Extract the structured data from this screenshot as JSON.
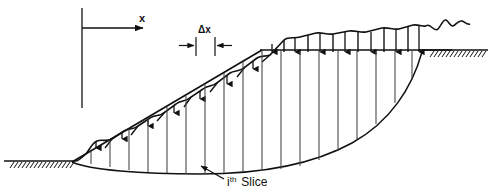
{
  "figure": {
    "background_color": "#ffffff",
    "line_color": "#111111",
    "thin_line_color": "#4a4a4a"
  },
  "labels": {
    "x_axis": "x",
    "delta_x": "Δx",
    "slice_prefix": "i",
    "slice_superscript": "th",
    "slice_word": "Slice"
  },
  "geometry": {
    "axis": {
      "vertical_x": 82,
      "vertical_y_top": 8,
      "vertical_y_bottom": 108,
      "arrow_y": 28,
      "arrow_x_start": 82,
      "arrow_x_end": 146,
      "label_x": 139,
      "label_y": 22
    },
    "ground_left": {
      "x_start": 4,
      "x_end": 75,
      "y": 161,
      "hatch_count": 16
    },
    "ground_right": {
      "x_start": 424,
      "x_end": 488,
      "y": 50,
      "hatch_count": 14
    },
    "slope_toe": {
      "x": 72,
      "y": 162
    },
    "slope_crest": {
      "x": 262,
      "y": 50
    },
    "top_datum": {
      "x_start": 262,
      "x_end": 450,
      "y": 50
    },
    "delta_x_dim": {
      "y": 45,
      "tick_left_x": 196,
      "tick_right_x": 215,
      "label_x": 205,
      "label_y": 31
    },
    "slip_surface": {
      "start_x": 72,
      "start_y": 162,
      "end_x": 424,
      "end_y": 50,
      "lowest_y": 172
    },
    "slice_label_leader": {
      "from_x": 224,
      "from_y": 178,
      "to_x": 199,
      "to_y": 166,
      "text_x": 227,
      "text_y": 184
    },
    "slice_width": 19,
    "slice_lines_x": [
      91,
      110,
      129,
      148,
      167,
      186,
      205,
      224,
      243,
      262,
      281,
      300,
      319,
      338,
      357,
      376,
      395,
      414
    ],
    "surcharge_arrows_x": [
      100,
      124,
      148,
      172,
      196,
      220,
      244,
      272,
      296,
      320,
      344,
      368,
      392,
      414
    ]
  },
  "surface_profile": {
    "description": "irregular natural ground surface above the slope and crest",
    "points": "wavy line following above the slope face and the top datum",
    "end_break_x": 450
  }
}
